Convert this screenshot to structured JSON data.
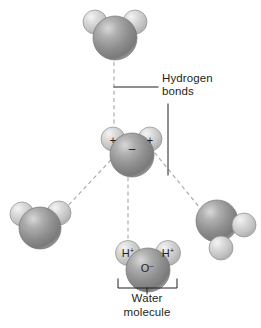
{
  "figure": {
    "background_color": "#ffffff",
    "line_color": "#231f20",
    "bond_line_color": "#9a9a9a"
  },
  "labels": {
    "hydrogen_bonds_line1": "Hydrogen",
    "hydrogen_bonds_line2": "bonds",
    "water_molecule_line1": "Water",
    "water_molecule_line2": "molecule"
  },
  "atoms": {
    "oxygen_color": "#8d8d8d",
    "oxygen_highlight": "#d6d6d6",
    "oxygen_shadow": "#6a6a6a",
    "hydrogen_color": "#c9c9c9",
    "hydrogen_highlight": "#f2f2f2",
    "hydrogen_shadow": "#9b9b9b"
  },
  "charges": {
    "center_hydrogen_left": "+",
    "center_hydrogen_right": "+",
    "center_oxygen": "–",
    "bottom_hydrogen_left": "H",
    "bottom_hydrogen_left_sup": "+",
    "bottom_hydrogen_right": "H",
    "bottom_hydrogen_right_sup": "+",
    "bottom_oxygen": "O",
    "bottom_oxygen_sup": "–"
  },
  "molecules": [
    {
      "name": "top-water-molecule",
      "role": "hydrogen-bond-donor",
      "position": "top-center"
    },
    {
      "name": "center-water-molecule",
      "role": "central-polar-molecule",
      "position": "center"
    },
    {
      "name": "left-water-molecule",
      "role": "hydrogen-bond-partner",
      "position": "lower-left"
    },
    {
      "name": "right-water-molecule",
      "role": "hydrogen-bond-partner",
      "position": "lower-right"
    },
    {
      "name": "bottom-water-molecule",
      "role": "labeled-water-molecule",
      "position": "bottom-center"
    }
  ],
  "bonds": [
    {
      "name": "bond-top-to-center",
      "style": "dashed"
    },
    {
      "name": "bond-center-to-left",
      "style": "dashed"
    },
    {
      "name": "bond-center-to-right",
      "style": "dashed"
    },
    {
      "name": "bond-center-to-bottom",
      "style": "dashed"
    }
  ]
}
